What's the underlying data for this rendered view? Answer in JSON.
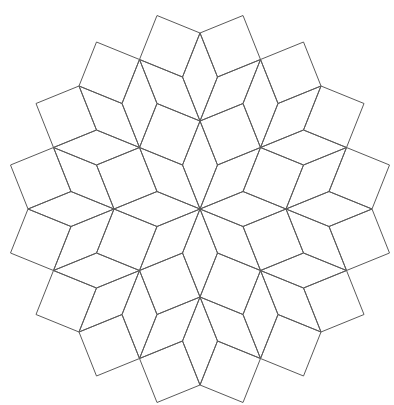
{
  "figure": {
    "background": "#ffffff",
    "stroke_color": "#5a5a5a",
    "stroke_width": 1,
    "center": [
      200,
      209
    ],
    "basis": [
      [
        17.5,
        -44
      ],
      [
        43,
        -17.5
      ],
      [
        43,
        17.5
      ],
      [
        17.5,
        44
      ]
    ],
    "rotational_symmetry": 8,
    "tile_kinds": {
      "rhombus": "45° rhombus",
      "square": "square"
    },
    "fundamental_tiles": [
      {
        "kind": "rhombus",
        "base": [
          0,
          0,
          0,
          0
        ],
        "dirs": [
          0,
          1
        ]
      },
      {
        "kind": "square",
        "base": [
          1,
          0,
          0,
          0
        ],
        "dirs": [
          1,
          7
        ]
      },
      {
        "kind": "rhombus",
        "base": [
          1,
          1,
          0,
          -1
        ],
        "dirs": [
          0,
          3
        ]
      },
      {
        "kind": "rhombus",
        "base": [
          1,
          0,
          0,
          -1
        ],
        "dirs": [
          0,
          1
        ]
      },
      {
        "kind": "square",
        "base": [
          2,
          0,
          0,
          -1
        ],
        "dirs": [
          7,
          1
        ]
      },
      {
        "kind": "square",
        "base": [
          2,
          1,
          0,
          -1
        ],
        "dirs": [
          1,
          3
        ]
      },
      {
        "kind": "rhombus",
        "base": [
          1,
          1,
          0,
          0
        ],
        "dirs": [
          0,
          1
        ]
      },
      {
        "kind": "rhombus",
        "base": [
          1,
          1,
          0,
          0
        ],
        "dirs": [
          1,
          2
        ]
      },
      {
        "kind": "square",
        "base": [
          0,
          1,
          0,
          0
        ],
        "dirs": [
          0,
          2
        ]
      },
      {
        "kind": "square",
        "base": [
          1,
          2,
          0,
          0
        ],
        "dirs": [
          0,
          2
        ]
      },
      {
        "kind": "square",
        "base": [
          0,
          2,
          1,
          0
        ],
        "dirs": [
          0,
          2
        ]
      },
      {
        "kind": "rhombus",
        "base": [
          0,
          1,
          1,
          0
        ],
        "dirs": [
          0,
          1
        ]
      }
    ]
  }
}
